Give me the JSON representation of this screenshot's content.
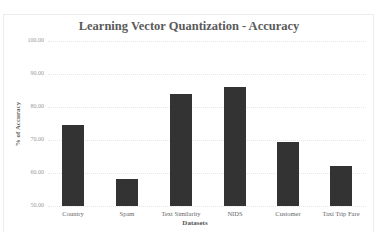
{
  "chart_data": {
    "type": "bar",
    "title": "Learning Vector Quantization - Accuracy",
    "xlabel": "Datasets",
    "ylabel": "% of Accuracy",
    "categories": [
      "Country",
      "Spam",
      "Text Similarity",
      "NIDS",
      "Customer",
      "Taxi Trip Fare"
    ],
    "values": [
      74.5,
      58.2,
      84.0,
      86.0,
      69.4,
      62.1
    ],
    "ylim": [
      50,
      100
    ],
    "yticks": [
      "50.00",
      "60.00",
      "70.00",
      "80.00",
      "90.00",
      "100.00"
    ],
    "grid": true,
    "legend": null,
    "bar_color": "#333333"
  }
}
